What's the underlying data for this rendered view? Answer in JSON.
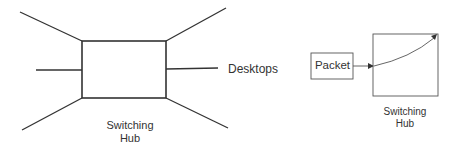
{
  "left_diagram": {
    "hub_label_line1": "Switching",
    "hub_label_line2": "Hub",
    "connection_label": "Desktops"
  },
  "right_diagram": {
    "packet_label": "Packet",
    "hub_label_line1": "Switching",
    "hub_label_line2": "Hub"
  }
}
